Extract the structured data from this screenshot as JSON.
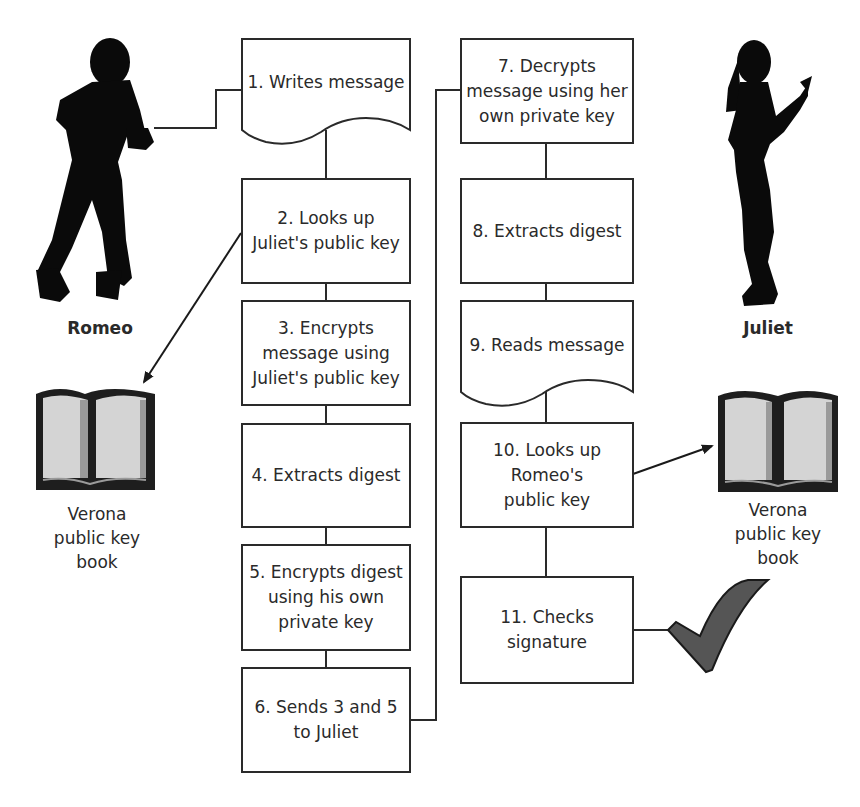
{
  "diagram": {
    "type": "flowchart",
    "topic": "Digital signature with public key encryption",
    "actors": {
      "sender": {
        "name": "Romeo"
      },
      "receiver": {
        "name": "Juliet"
      }
    },
    "key_books": {
      "left": {
        "label": "Verona\npublic key\nbook"
      },
      "right": {
        "label": "Verona\npublic key\nbook"
      }
    },
    "sender_steps": [
      {
        "id": 1,
        "text": "1. Writes message",
        "shape": "document"
      },
      {
        "id": 2,
        "text": "2. Looks up\nJuliet's public key",
        "shape": "process"
      },
      {
        "id": 3,
        "text": "3. Encrypts\nmessage using\nJuliet's public key",
        "shape": "process"
      },
      {
        "id": 4,
        "text": "4. Extracts digest",
        "shape": "process"
      },
      {
        "id": 5,
        "text": "5. Encrypts digest\nusing  his own\nprivate key",
        "shape": "process"
      },
      {
        "id": 6,
        "text": "6. Sends 3 and 5\nto Juliet",
        "shape": "process"
      }
    ],
    "receiver_steps": [
      {
        "id": 7,
        "text": "7. Decrypts\nmessage using her\nown private key",
        "shape": "process"
      },
      {
        "id": 8,
        "text": "8. Extracts digest",
        "shape": "process"
      },
      {
        "id": 9,
        "text": "9. Reads message",
        "shape": "document"
      },
      {
        "id": 10,
        "text": "10. Looks up\nRomeo's\npublic key",
        "shape": "process"
      },
      {
        "id": 11,
        "text": "11. Checks\nsignature",
        "shape": "process"
      }
    ],
    "connections": [
      {
        "from": "Romeo",
        "to": "1"
      },
      {
        "from": "1",
        "to": "2"
      },
      {
        "from": "2",
        "to": "left-key-book",
        "arrow": true
      },
      {
        "from": "2",
        "to": "3"
      },
      {
        "from": "3",
        "to": "4"
      },
      {
        "from": "4",
        "to": "5"
      },
      {
        "from": "5",
        "to": "6"
      },
      {
        "from": "6",
        "to": "7"
      },
      {
        "from": "7",
        "to": "8"
      },
      {
        "from": "8",
        "to": "9"
      },
      {
        "from": "9",
        "to": "10"
      },
      {
        "from": "10",
        "to": "right-key-book",
        "arrow": true
      },
      {
        "from": "10",
        "to": "11"
      },
      {
        "from": "11",
        "to": "checkmark"
      }
    ],
    "result_icon": "checkmark-icon",
    "colors": {
      "line": "#2a2a2a",
      "silhouette": "#0a0a0a",
      "book_cover": "#1e1e1e",
      "book_page": "#d4d4d4",
      "checkmark": "#555555"
    }
  }
}
